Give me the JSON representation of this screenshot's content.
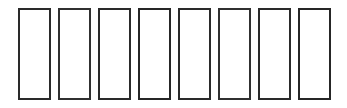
{
  "figure": {
    "background_color": "#ffffff",
    "width": 347,
    "height": 108
  },
  "style": {
    "stroke_color": "#2b2b2b",
    "fill_color": "#ffffff",
    "stroke_width_px": 2
  },
  "shapes": [
    {
      "label": "",
      "index": 1,
      "x": 18,
      "y": 8,
      "width": 33,
      "height": 92,
      "shape": "rectangle"
    },
    {
      "label": "",
      "index": 2,
      "x": 58,
      "y": 8,
      "width": 33,
      "height": 92,
      "shape": "rectangle"
    },
    {
      "label": "",
      "index": 3,
      "x": 98,
      "y": 8,
      "width": 33,
      "height": 92,
      "shape": "rectangle"
    },
    {
      "label": "",
      "index": 4,
      "x": 138,
      "y": 8,
      "width": 33,
      "height": 92,
      "shape": "rectangle"
    },
    {
      "label": "",
      "index": 5,
      "x": 178,
      "y": 8,
      "width": 33,
      "height": 92,
      "shape": "rectangle"
    },
    {
      "label": "",
      "index": 6,
      "x": 218,
      "y": 8,
      "width": 33,
      "height": 92,
      "shape": "rectangle"
    },
    {
      "label": "",
      "index": 7,
      "x": 258,
      "y": 8,
      "width": 33,
      "height": 92,
      "shape": "rectangle"
    },
    {
      "label": "",
      "index": 8,
      "x": 298,
      "y": 8,
      "width": 33,
      "height": 92,
      "shape": "rectangle"
    }
  ]
}
